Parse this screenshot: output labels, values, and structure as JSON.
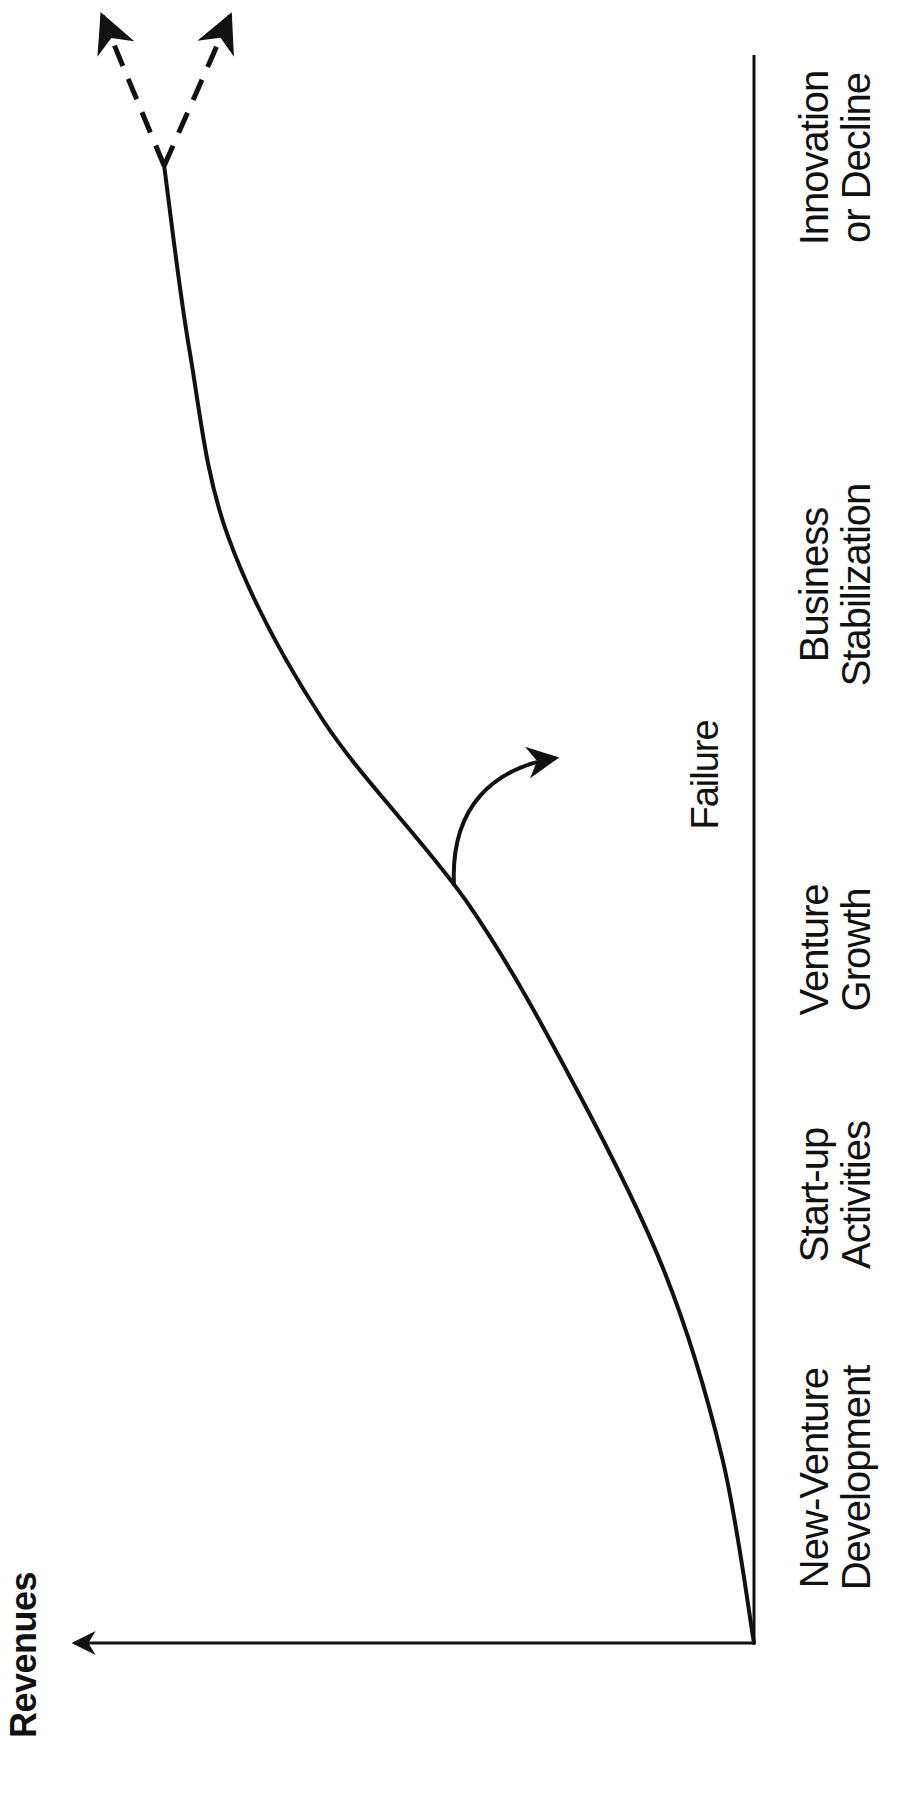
{
  "chart_data": {
    "type": "line",
    "title": "",
    "xlabel": "Stages of Venture Life Cycle (partially cropped)",
    "ylabel": "Revenues",
    "categories": [
      "New-Venture Development",
      "Start-up Activities",
      "Venture Growth",
      "Business Stabilization",
      "Innovation or Decline"
    ],
    "stages": [
      {
        "line1": "New-Venture",
        "line2": "Development"
      },
      {
        "line1": "Start-up",
        "line2": "Activities"
      },
      {
        "line1": "Venture",
        "line2": "Growth"
      },
      {
        "line1": "Business",
        "line2": "Stabilization"
      },
      {
        "line1": "Innovation",
        "line2": "or Decline"
      }
    ],
    "series": [
      {
        "name": "Revenues",
        "x": [
          0,
          0.5,
          1.0,
          1.5,
          2.0,
          2.5,
          3.0,
          3.5,
          4.0
        ],
        "values": [
          0,
          0.05,
          0.14,
          0.28,
          0.45,
          0.68,
          0.83,
          0.89,
          0.93
        ]
      }
    ],
    "annotations": [
      {
        "text": "Failure",
        "branch_from_x": 2.05,
        "direction": "down"
      },
      {
        "text": "",
        "type": "dashed-fork",
        "from_x": 4.0,
        "directions": [
          "up (innovation)",
          "down (decline)"
        ]
      }
    ],
    "axis_ranges": {
      "x": [
        0,
        4.3
      ],
      "y": [
        0,
        1
      ]
    },
    "grid": false,
    "legend": "none",
    "orientation": "rotated-90-ccw"
  },
  "colors": {
    "ink": "#111111",
    "background": "#ffffff"
  }
}
